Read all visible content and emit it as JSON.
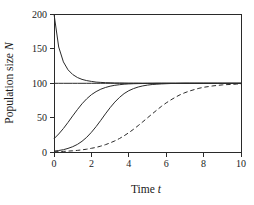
{
  "figure": {
    "background": "#ffffff",
    "line_color": "#2a2a2a",
    "text_color": "#1a1a1a"
  },
  "chart_data": {
    "type": "line",
    "title": "",
    "xlabel": {
      "text": "Time",
      "variable": "t"
    },
    "ylabel": {
      "text": "Population size",
      "variable": "N"
    },
    "xlim": [
      0,
      10
    ],
    "ylim": [
      0,
      200
    ],
    "xticks": [
      0,
      2,
      4,
      6,
      8,
      10
    ],
    "yticks": [
      0,
      50,
      100,
      150,
      200
    ],
    "grid": false,
    "legend": null,
    "frame": "box",
    "carrying_capacity": 100,
    "x_step": 0.25,
    "x": [
      0,
      0.25,
      0.5,
      0.75,
      1,
      1.25,
      1.5,
      1.75,
      2,
      2.25,
      2.5,
      2.75,
      3,
      3.25,
      3.5,
      3.75,
      4,
      4.25,
      4.5,
      4.75,
      5,
      5.25,
      5.5,
      5.75,
      6,
      6.25,
      6.5,
      6.75,
      7,
      7.25,
      7.5,
      7.75,
      8,
      8.25,
      8.5,
      8.75,
      9,
      9.25,
      9.5,
      9.75,
      10
    ],
    "series": [
      {
        "name": "N0 = 200 (decline toward K = 100)",
        "style": "solid",
        "values": [
          200,
          152.4,
          130.9,
          119.4,
          112.6,
          108.3,
          105.6,
          103.8,
          102.6,
          101.7,
          101.2,
          100.8,
          100.6,
          100.4,
          100.3,
          100.2,
          100.1,
          100.1,
          100.1,
          100,
          100,
          100,
          100,
          100,
          100,
          100,
          100,
          100,
          100,
          100,
          100,
          100,
          100,
          100,
          100,
          100,
          100,
          100,
          100,
          100,
          100
        ]
      },
      {
        "name": "N0 = 100 (equilibrium at K)",
        "style": "solid",
        "values": [
          100,
          100,
          100,
          100,
          100,
          100,
          100,
          100,
          100,
          100,
          100,
          100,
          100,
          100,
          100,
          100,
          100,
          100,
          100,
          100,
          100,
          100,
          100,
          100,
          100,
          100,
          100,
          100,
          100,
          100,
          100,
          100,
          100,
          100,
          100,
          100,
          100,
          100,
          100,
          100,
          100
        ]
      },
      {
        "name": "N0 = 20",
        "style": "solid",
        "values": [
          20,
          26.7,
          34.6,
          43.5,
          52.8,
          62,
          70.3,
          77.5,
          83.4,
          88,
          91.4,
          93.9,
          95.7,
          97,
          97.9,
          98.6,
          99,
          99.3,
          99.5,
          99.7,
          99.8,
          99.8,
          99.9,
          99.9,
          99.9,
          100,
          100,
          100,
          100,
          100,
          100,
          100,
          100,
          100,
          100,
          100,
          100,
          100,
          100,
          100,
          100
        ]
      },
      {
        "name": "N0 = 2",
        "style": "solid",
        "values": [
          2,
          2.9,
          4.1,
          5.9,
          8.4,
          11.7,
          16.2,
          22,
          29.1,
          37.4,
          46.5,
          55.8,
          64.7,
          72.8,
          79.5,
          85,
          89.2,
          92.3,
          94.6,
          96.2,
          97.4,
          98.2,
          98.7,
          99.1,
          99.4,
          99.6,
          99.7,
          99.8,
          99.9,
          99.9,
          99.9,
          100,
          100,
          100,
          100,
          100,
          100,
          100,
          100,
          100,
          100
        ]
      },
      {
        "name": "N0 = 1 (slower growth, dashed)",
        "style": "dashed",
        "values": [
          1,
          1.3,
          1.6,
          2,
          2.5,
          3.1,
          3.9,
          4.8,
          6,
          7.4,
          9.2,
          11.3,
          13.8,
          16.7,
          20.2,
          24.1,
          28.6,
          33.5,
          38.8,
          44.4,
          50.1,
          55.8,
          61.4,
          66.7,
          71.6,
          76,
          80,
          83.4,
          86.4,
          88.8,
          90.9,
          92.7,
          94.1,
          95.2,
          96.2,
          96.9,
          97.6,
          98,
          98.4,
          98.8,
          99
        ]
      }
    ]
  }
}
